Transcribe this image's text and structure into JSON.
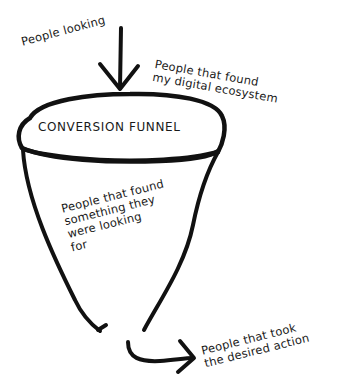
{
  "diagram": {
    "type": "conversion-funnel-sketch",
    "title": "CONVERSION FUNNEL",
    "stages": [
      {
        "id": "looking",
        "label": "People looking"
      },
      {
        "id": "found-ecosystem",
        "label": "People that found\nmy digital ecosystem"
      },
      {
        "id": "found-something",
        "label": "People that found\nsomething they\nwere looking\nfor"
      },
      {
        "id": "took-action",
        "label": "People that took\nthe desired action"
      }
    ],
    "colors": {
      "stroke": "#111111",
      "text": "#1a1a1a",
      "background": "#ffffff"
    }
  }
}
